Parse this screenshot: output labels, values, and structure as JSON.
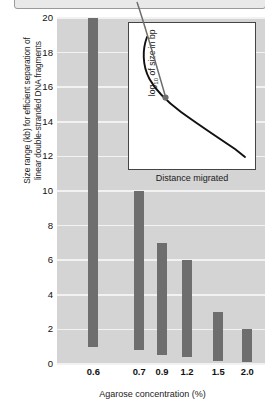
{
  "caption": {
    "text": "",
    "visible_fragment": ""
  },
  "colors": {
    "plot_background": "#d4d4d4",
    "gridline": "#f2f2f2",
    "bar": "#6e6e6e",
    "inset_background": "#ffffff",
    "inset_border": "#444444",
    "curve": "#111111",
    "pointer": "#6e6e6e",
    "text": "#111111"
  },
  "chart_data": {
    "type": "bar",
    "title": "",
    "subtitle": "",
    "xlabel": "Agarose concentration (%)",
    "ylabel": "Size range (kb) for efficient separation of linear double-stranded DNA fragments",
    "categories": [
      "0.6",
      "0.7",
      "0.9",
      "1.2",
      "1.5",
      "2.0"
    ],
    "ranges": [
      {
        "category": "0.6",
        "low": 1.0,
        "high": 20.0
      },
      {
        "category": "0.7",
        "low": 0.8,
        "high": 10.0
      },
      {
        "category": "0.9",
        "low": 0.5,
        "high": 7.0
      },
      {
        "category": "1.2",
        "low": 0.4,
        "high": 6.0
      },
      {
        "category": "1.5",
        "low": 0.2,
        "high": 3.0
      },
      {
        "category": "2.0",
        "low": 0.1,
        "high": 2.0
      }
    ],
    "ylim": [
      0,
      20
    ],
    "yticks": [
      "0",
      "2",
      "4",
      "6",
      "8",
      "10",
      "12",
      "14",
      "16",
      "18",
      "20"
    ],
    "ytick_values": [
      0,
      2,
      4,
      6,
      8,
      10,
      12,
      14,
      16,
      18,
      20
    ],
    "grid": true,
    "legend": "none",
    "note": "Floating bars show the kb size range over which each agarose percentage efficiently separates linear dsDNA."
  },
  "inset": {
    "type": "line",
    "xlabel": "Distance migrated",
    "ylabel_main": "of size in bp",
    "ylabel_prefix": "log",
    "ylabel_sub": "10",
    "grid": false,
    "curve_description": "Sigmoid-like calibration curve: steep drop at small migration distances flattening into a near-linear decline",
    "annotation": {
      "type": "arrow-pointer",
      "target_label": "point on calibration curve",
      "has_dot_head": true
    }
  },
  "axes": {
    "y_title": "Size range (kb) for efficient separation of linear double-stranded DNA fragments",
    "y_title_line1": "Size range (kb) for efficient separation of",
    "y_title_line2": "linear double-stranded DNA fragments",
    "x_title": "Agarose concentration (%)"
  }
}
